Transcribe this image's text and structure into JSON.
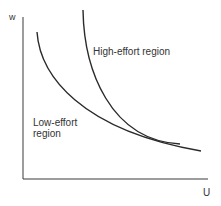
{
  "diagram": {
    "axes": {
      "y_label": "w",
      "x_label": "U"
    },
    "curves": [
      {
        "name": "low-effort boundary",
        "path": "M37,32 C40,75 80,130 201,151"
      },
      {
        "name": "high-effort boundary",
        "path": "M83,10 C84,70 110,140 180,144"
      }
    ],
    "regions": [
      {
        "label_lines": [
          "High-effort region"
        ]
      },
      {
        "label_lines": [
          "Low-effort",
          "region"
        ]
      }
    ],
    "colors": {
      "line": "#2a2a2a",
      "text": "#333333"
    }
  }
}
